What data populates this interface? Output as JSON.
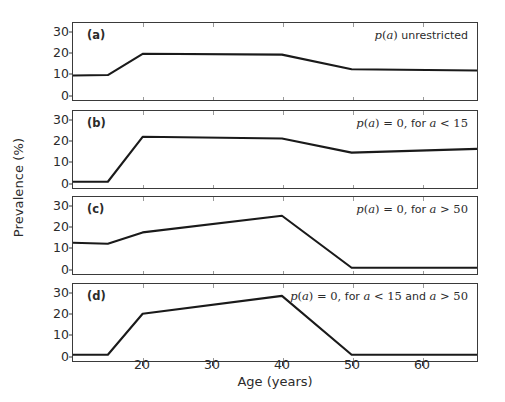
{
  "figure": {
    "xlabel": "Age (years)",
    "ylabel": "Prevalence (%)",
    "xticks": [
      20,
      30,
      40,
      50,
      60
    ],
    "yticks": [
      0,
      10,
      20,
      30
    ],
    "xlim": [
      10,
      68
    ],
    "ylim": [
      -3,
      34
    ],
    "line_color": "#1a1a1a",
    "axis_color": "#3a3a3a",
    "background": "#ffffff"
  },
  "chart_data": {
    "type": "line",
    "title": "",
    "xlabel": "Age (years)",
    "ylabel": "Prevalence (%)",
    "xlim": [
      10,
      68
    ],
    "ylim": [
      -3,
      34
    ],
    "xticks": [
      20,
      30,
      40,
      50,
      60
    ],
    "yticks": [
      0,
      10,
      20,
      30
    ],
    "grid": false,
    "legend": "none",
    "panels": [
      {
        "tag": "(a)",
        "annotation": "p(a) unrestricted",
        "annotation_parts": [
          {
            "text": "p",
            "style": "italic"
          },
          {
            "text": "(",
            "style": "math"
          },
          {
            "text": "a",
            "style": "italic"
          },
          {
            "text": ")",
            "style": "math"
          },
          {
            "text": " unrestricted",
            "style": "normal"
          }
        ],
        "x": [
          10,
          15,
          20,
          40,
          50,
          68
        ],
        "y": [
          8.8,
          9.0,
          19.2,
          18.8,
          11.8,
          11.2
        ]
      },
      {
        "tag": "(b)",
        "annotation": "p(a) = 0, for a < 15",
        "annotation_parts": [
          {
            "text": "p",
            "style": "italic"
          },
          {
            "text": "(",
            "style": "math"
          },
          {
            "text": "a",
            "style": "italic"
          },
          {
            "text": ") = 0,",
            "style": "math"
          },
          {
            "text": " for ",
            "style": "normal"
          },
          {
            "text": "a",
            "style": "italic"
          },
          {
            "text": " < 15",
            "style": "math"
          }
        ],
        "x": [
          10,
          15,
          20,
          40,
          50,
          68
        ],
        "y": [
          0,
          0,
          21.6,
          20.8,
          14.0,
          15.8
        ]
      },
      {
        "tag": "(c)",
        "annotation": "p(a) = 0, for a > 50",
        "annotation_parts": [
          {
            "text": "p",
            "style": "italic"
          },
          {
            "text": "(",
            "style": "math"
          },
          {
            "text": "a",
            "style": "italic"
          },
          {
            "text": ") = 0,",
            "style": "math"
          },
          {
            "text": " for ",
            "style": "normal"
          },
          {
            "text": "a",
            "style": "italic"
          },
          {
            "text": " > 50",
            "style": "math"
          }
        ],
        "x": [
          10,
          15,
          20,
          40,
          50,
          68
        ],
        "y": [
          12.0,
          11.5,
          17.0,
          25.0,
          0,
          0
        ]
      },
      {
        "tag": "(d)",
        "annotation": "p(a) = 0, for a < 15 and a > 50",
        "annotation_parts": [
          {
            "text": "p",
            "style": "italic"
          },
          {
            "text": "(",
            "style": "math"
          },
          {
            "text": "a",
            "style": "italic"
          },
          {
            "text": ") = 0,",
            "style": "math"
          },
          {
            "text": " for ",
            "style": "normal"
          },
          {
            "text": "a",
            "style": "italic"
          },
          {
            "text": " < 15",
            "style": "math"
          },
          {
            "text": " and ",
            "style": "normal"
          },
          {
            "text": "a",
            "style": "italic"
          },
          {
            "text": " > 50",
            "style": "math"
          }
        ],
        "x": [
          10,
          15,
          20,
          40,
          50,
          68
        ],
        "y": [
          0,
          0,
          19.7,
          28.3,
          0,
          0
        ]
      }
    ]
  }
}
